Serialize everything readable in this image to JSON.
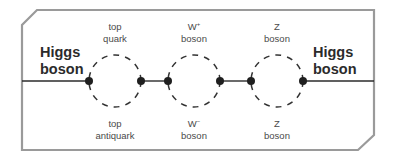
{
  "diagram": {
    "left_label": {
      "line1": "Higgs",
      "line2": "boson"
    },
    "right_label": {
      "line1": "Higgs",
      "line2": "boson"
    },
    "loops": [
      {
        "top": {
          "line1": "top",
          "line2": "quark"
        },
        "bottom": {
          "line1": "top",
          "line2": "antiquark"
        }
      },
      {
        "top": {
          "line1": "W",
          "sup": "+",
          "line2": "boson"
        },
        "bottom": {
          "line1": "W",
          "sup": "−",
          "line2": "boson"
        }
      },
      {
        "top": {
          "line1": "Z",
          "line2": "boson"
        },
        "bottom": {
          "line1": "Z",
          "line2": "boson"
        }
      }
    ],
    "colors": {
      "frame": "#9a9a9a",
      "line": "#2b2b2b",
      "vertex": "#1f1f1f",
      "dash": "#333333"
    }
  }
}
